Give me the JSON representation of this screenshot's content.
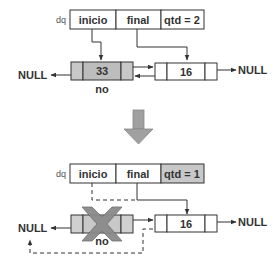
{
  "diagram": {
    "before": {
      "struct_label": "dq",
      "fields": [
        "inicio",
        "final",
        "qtd = 2"
      ],
      "nodes": [
        {
          "value": "33",
          "label": "no",
          "highlighted": true
        },
        {
          "value": "16",
          "label": "",
          "highlighted": false
        }
      ],
      "null_left": "NULL",
      "null_right": "NULL"
    },
    "transition": {
      "icon": "down-arrow-icon"
    },
    "after": {
      "struct_label": "dq",
      "fields": [
        "inicio",
        "final",
        "qtd = 1"
      ],
      "highlighted_field": "qtd = 1",
      "removed_node": {
        "label": "no",
        "mark": "x-mark-icon"
      },
      "nodes": [
        {
          "value": "16",
          "label": "",
          "highlighted": false
        }
      ],
      "null_left": "NULL",
      "null_right": "NULL"
    },
    "colors": {
      "stroke": "#333333",
      "fill_gray": "#bfbfbf",
      "fill_light_gray": "#d4d4d4",
      "arrow_gray": "#9a9a9a",
      "x_mark": "#8a8a8a",
      "background": "#ffffff"
    }
  }
}
